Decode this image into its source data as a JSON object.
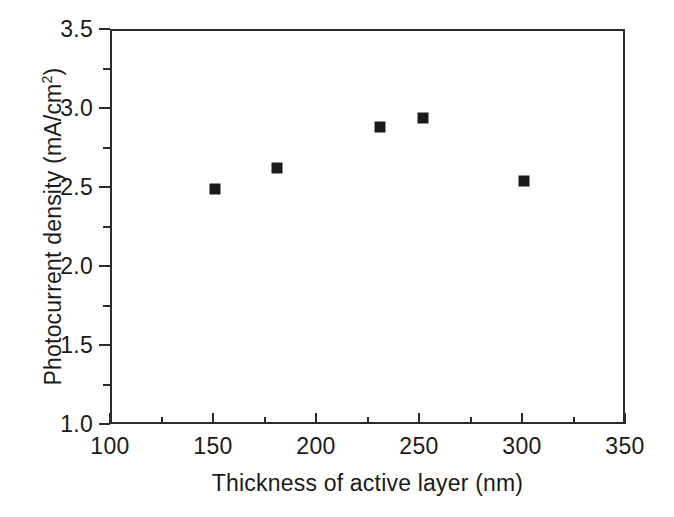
{
  "chart_data": {
    "type": "scatter",
    "title": "",
    "xlabel": "Thickness of active layer (nm)",
    "ylabel_text": "Photocurrent density (mA/cm",
    "ylabel_sup": "2",
    "ylabel_tail": ")",
    "ylabel_full": "Photocurrent density (mA/cm2)",
    "xlim": [
      100,
      350
    ],
    "ylim": [
      1.0,
      3.5
    ],
    "grid": false,
    "legend": null,
    "x": [
      150,
      180,
      230,
      251,
      300
    ],
    "values": [
      2.5,
      2.63,
      2.89,
      2.95,
      2.55
    ],
    "points": [
      {
        "x": 150,
        "y": 2.5
      },
      {
        "x": 180,
        "y": 2.63
      },
      {
        "x": 230,
        "y": 2.89
      },
      {
        "x": 251,
        "y": 2.95
      },
      {
        "x": 300,
        "y": 2.55
      }
    ],
    "xticks": [
      100,
      150,
      200,
      250,
      300,
      350
    ],
    "xtick_labels": [
      "100",
      "150",
      "200",
      "250",
      "300",
      "350"
    ],
    "xminor_ticks": [
      125,
      175,
      225,
      275,
      325
    ],
    "yticks": [
      1.0,
      1.5,
      2.0,
      2.5,
      3.0,
      3.5
    ],
    "ytick_labels": [
      "1.0",
      "1.5",
      "2.0",
      "2.5",
      "3.0",
      "3.5"
    ],
    "yminor_ticks": [
      1.25,
      1.75,
      2.25,
      2.75,
      3.25
    ],
    "marker_style": "filled-square",
    "marker_color": "#1a1a1a",
    "axis_color": "#2b2b2b",
    "background_color": "#ffffff"
  }
}
